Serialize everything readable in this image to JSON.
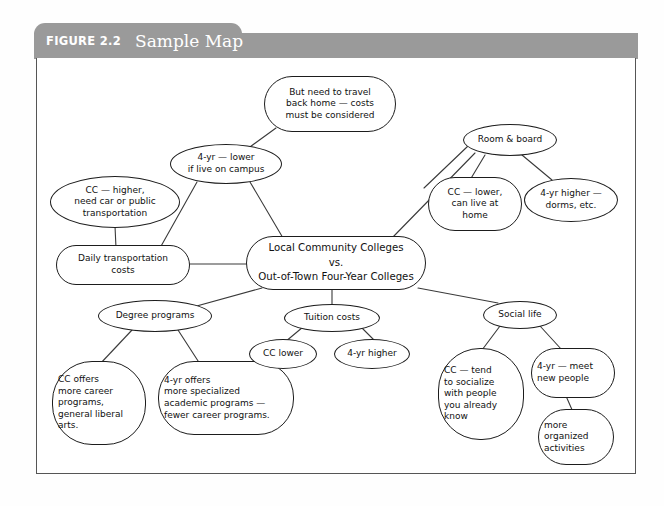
{
  "figure": {
    "label": "FIGURE 2.2",
    "title": "Sample Map"
  },
  "colors": {
    "banner": "#9a9a9a",
    "banner_text": "#ffffff",
    "frame_border": "#555555",
    "node_border": "#1d1d1d",
    "node_fill": "#ffffff",
    "page_background": "#ffffff",
    "connector": "#3a3a3a"
  },
  "map": {
    "center": {
      "id": "center",
      "label": "Local Community Colleges\nvs.\nOut-of-Town Four-Year Colleges"
    },
    "nodes": [
      {
        "id": "travel-home",
        "label": "But need to travel\nback home — costs\nmust be considered"
      },
      {
        "id": "four-yr-lower",
        "label": "4-yr — lower\nif live on campus"
      },
      {
        "id": "cc-higher",
        "label": "CC — higher,\nneed car or public\ntransportation"
      },
      {
        "id": "daily-transport",
        "label": "Daily transportation\ncosts"
      },
      {
        "id": "room-board",
        "label": "Room & board"
      },
      {
        "id": "cc-lower-home",
        "label": "CC — lower,\ncan live at\nhome"
      },
      {
        "id": "four-yr-dorms",
        "label": "4-yr higher —\ndorms, etc."
      },
      {
        "id": "degree-programs",
        "label": "Degree programs"
      },
      {
        "id": "cc-career",
        "label": "CC offers\nmore career\nprograms,\ngeneral liberal\narts."
      },
      {
        "id": "four-yr-academic",
        "label": "4-yr offers\nmore specialized\nacademic programs —\nfewer career programs."
      },
      {
        "id": "tuition-costs",
        "label": "Tuition costs"
      },
      {
        "id": "cc-lower-tuition",
        "label": "CC lower"
      },
      {
        "id": "four-yr-higher",
        "label": "4-yr higher"
      },
      {
        "id": "social-life",
        "label": "Social life"
      },
      {
        "id": "cc-socialize",
        "label": "CC — tend\nto socialize\nwith people\nyou already\nknow"
      },
      {
        "id": "four-yr-meet",
        "label": "4-yr — meet\nnew people"
      },
      {
        "id": "more-organized",
        "label": "more\norganized\nactivities"
      }
    ]
  }
}
